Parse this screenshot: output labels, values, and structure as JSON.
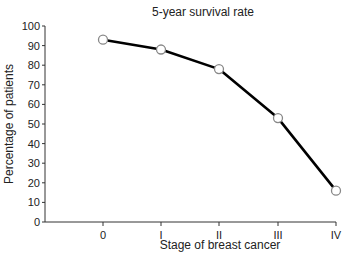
{
  "chart_data": {
    "type": "line",
    "title": "5-year survival rate",
    "xlabel": "Stage of breast cancer",
    "ylabel": "Percentage of patients",
    "categories": [
      "0",
      "I",
      "II",
      "III",
      "IV"
    ],
    "series": [
      {
        "name": "5-year survival rate",
        "values": [
          93,
          88,
          78,
          53,
          16
        ]
      }
    ],
    "ylim": [
      0,
      100
    ],
    "yticks": [
      "0",
      "10",
      "20",
      "30",
      "40",
      "50",
      "60",
      "70",
      "80",
      "90",
      "100"
    ],
    "grid": false,
    "legend": "none"
  }
}
